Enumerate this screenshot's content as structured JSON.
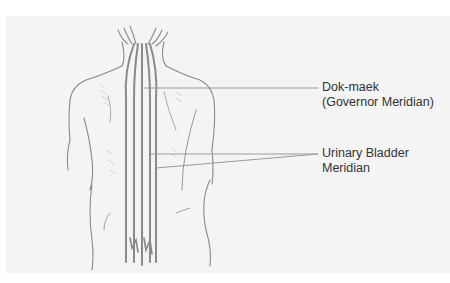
{
  "diagram": {
    "colors": {
      "background": "#ffffff",
      "panel": "#f4f4f4",
      "outline": "#8a8a8a",
      "meridian": "#888888",
      "leader": "#9a9a9a",
      "text": "#333333"
    },
    "labels": [
      {
        "id": "governor",
        "line1": "Dok-maek",
        "line2": "(Governor Meridian)"
      },
      {
        "id": "urinary_bladder",
        "line1": "Urinary Bladder",
        "line2": "Meridian"
      }
    ]
  }
}
